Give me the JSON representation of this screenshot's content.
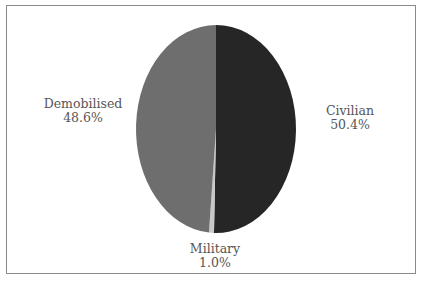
{
  "chart_data": {
    "type": "pie",
    "title": "",
    "slices": [
      {
        "label": "Civilian",
        "value": 50.4,
        "display": "50.4%",
        "color": "#262626"
      },
      {
        "label": "Military",
        "value": 1.0,
        "display": "1.0%",
        "color": "#c8c8c8"
      },
      {
        "label": "Demobilised",
        "value": 48.6,
        "display": "48.6%",
        "color": "#6e6e6e"
      }
    ],
    "start_angle_deg": 0,
    "direction": "clockwise",
    "legend": "none (direct labels)"
  },
  "labels": {
    "demobilised": {
      "name": "Demobilised",
      "pct": "48.6%"
    },
    "civilian": {
      "name": "Civilian",
      "pct": "50.4%"
    },
    "military": {
      "name": "Military",
      "pct": "1.0%"
    }
  },
  "header": {
    "title_partial": "' '"
  }
}
